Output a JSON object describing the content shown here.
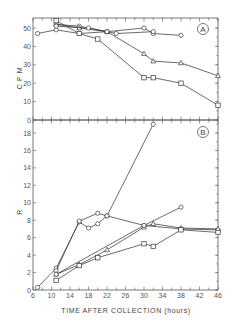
{
  "chart_data": [
    {
      "type": "line",
      "panel": "A",
      "title": "",
      "panel_label": "A",
      "xlabel": "",
      "ylabel": "C P M",
      "xlim": [
        6,
        46
      ],
      "ylim": [
        0,
        55
      ],
      "yticks": [
        0,
        10,
        20,
        30,
        40,
        50
      ],
      "grid": false,
      "legend": null,
      "series": [
        {
          "name": "series-1",
          "marker": "circle",
          "x": [
            7,
            11,
            16,
            22
          ],
          "y": [
            47,
            49,
            47,
            48
          ]
        },
        {
          "name": "series-2",
          "marker": "circle",
          "x": [
            11,
            16,
            22,
            30,
            32,
            38
          ],
          "y": [
            52,
            51,
            48,
            50,
            47,
            46
          ]
        },
        {
          "name": "series-3",
          "marker": "triangle",
          "x": [
            11,
            16,
            22,
            30,
            32,
            38,
            46
          ],
          "y": [
            52,
            50,
            48,
            36,
            32,
            31,
            24
          ]
        },
        {
          "name": "series-4",
          "marker": "square",
          "x": [
            11,
            16,
            20,
            30,
            32,
            38,
            46
          ],
          "y": [
            54,
            47,
            44,
            23,
            23,
            20,
            8
          ]
        },
        {
          "name": "series-5",
          "marker": "circle",
          "x": [
            11,
            18,
            22,
            24,
            32
          ],
          "y": [
            51,
            50,
            48,
            47,
            48
          ]
        }
      ]
    },
    {
      "type": "line",
      "panel": "B",
      "title": "",
      "panel_label": "B",
      "xlabel": "TIME AFTER COLLECTION (hours)",
      "ylabel": "R",
      "xlim": [
        6,
        46
      ],
      "ylim": [
        0,
        19.5
      ],
      "xticks": [
        6,
        10,
        14,
        18,
        22,
        26,
        30,
        34,
        38,
        42,
        46
      ],
      "yticks": [
        0,
        2,
        4,
        6,
        8,
        10,
        12,
        14,
        16,
        18
      ],
      "grid": false,
      "legend": null,
      "series": [
        {
          "name": "series-1",
          "marker": "circle",
          "x": [
            7,
            11,
            16,
            18,
            20,
            22,
            32
          ],
          "y": [
            0.3,
            2.5,
            7.8,
            7.1,
            7.6,
            8.5,
            19
          ]
        },
        {
          "name": "series-2",
          "marker": "circle",
          "x": [
            11,
            16,
            20,
            22,
            30,
            38,
            46
          ],
          "y": [
            2.2,
            7.9,
            8.8,
            8.5,
            7.4,
            7.0,
            6.9
          ]
        },
        {
          "name": "series-3",
          "marker": "triangle",
          "x": [
            11,
            16,
            22,
            30,
            32,
            38,
            46
          ],
          "y": [
            1.8,
            2.9,
            4.6,
            7.2,
            7.6,
            7.1,
            7.0
          ]
        },
        {
          "name": "series-4",
          "marker": "square",
          "x": [
            11,
            16,
            20,
            30,
            32,
            38,
            46
          ],
          "y": [
            1.1,
            2.8,
            3.7,
            5.3,
            5.0,
            6.9,
            6.6
          ]
        },
        {
          "name": "series-5",
          "marker": "circle",
          "x": [
            11,
            30,
            38
          ],
          "y": [
            1.8,
            7.4,
            9.5
          ]
        }
      ]
    }
  ],
  "labels": {
    "panel_a_tag": "A",
    "panel_b_tag": "B",
    "panel_a_ylabel": "C P M",
    "panel_b_ylabel": "R",
    "xlabel": "TIME AFTER COLLECTION (hours)",
    "panel_a_yticks": [
      "0",
      "10",
      "20",
      "30",
      "40",
      "50"
    ],
    "panel_b_yticks": [
      "0",
      "2",
      "4",
      "6",
      "8",
      "10",
      "12",
      "14",
      "16",
      "18"
    ],
    "xticks": [
      "6",
      "10",
      "14",
      "18",
      "22",
      "26",
      "30",
      "34",
      "38",
      "42",
      "46"
    ]
  },
  "colors": {
    "line": "#3a3a3a",
    "axis": "#555555",
    "text": "#555555",
    "background": "#ffffff"
  }
}
